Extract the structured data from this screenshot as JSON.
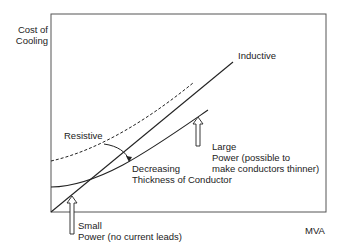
{
  "diagram": {
    "axes": {
      "y_label_line1": "Cost of",
      "y_label_line2": "Cooling",
      "x_label": "MVA"
    },
    "curves": {
      "inductive_label": "Inductive",
      "resistive_label": "Resistive"
    },
    "annotations": {
      "decreasing_line1": "Decreasing",
      "decreasing_line2": "Thickness of Conductor",
      "large_line1": "Large",
      "large_line2": "Power (possible to",
      "large_line3": "make conductors thinner)",
      "small_line1": "Small",
      "small_line2": "Power (no current leads)"
    },
    "colors": {
      "line": "#333333",
      "background": "#ffffff"
    }
  }
}
